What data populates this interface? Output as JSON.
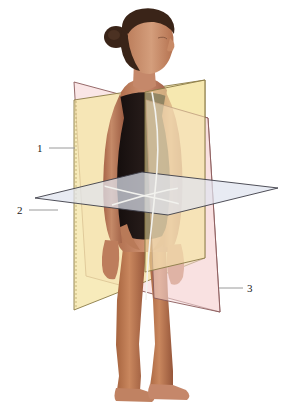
{
  "figure": {
    "background_color": "#ffffff",
    "width": 292,
    "height": 415
  },
  "subject": {
    "description": "Standing woman in dark swimsuit, anatomical position, head turned in right profile",
    "hair_color": "#3a2418",
    "skin_color": "#c08264",
    "skin_shadow": "#9a5f44",
    "skin_highlight": "#d8a183",
    "suit_color": "#1a1210",
    "suit_highlight": "#2e2220",
    "midline_color": "#f2f2ee"
  },
  "planes": [
    {
      "id": "sagittal",
      "callout": "1",
      "fill": "#f5e6a8",
      "stroke": "#8a7a46",
      "opacity": 0.78
    },
    {
      "id": "transverse",
      "callout": "2",
      "fill": "#dfe3ef",
      "stroke": "#3c3c46",
      "opacity": 0.72
    },
    {
      "id": "coronal",
      "callout": "3",
      "fill": "#f8dcdc",
      "stroke": "#8a5a5a",
      "opacity": 0.7
    }
  ],
  "callouts": [
    {
      "label": "1",
      "label_x": 37,
      "label_y": 152,
      "line_x1": 49,
      "line_y1": 148,
      "line_x2": 75,
      "line_y2": 148
    },
    {
      "label": "2",
      "label_x": 17,
      "label_y": 214,
      "line_x1": 29,
      "line_y1": 210,
      "line_x2": 58,
      "line_y2": 210
    },
    {
      "label": "3",
      "label_x": 247,
      "label_y": 292,
      "line_x1": 219,
      "line_y1": 288,
      "line_x2": 243,
      "line_y2": 288
    }
  ],
  "leader_line_color": "#9a9a9a"
}
